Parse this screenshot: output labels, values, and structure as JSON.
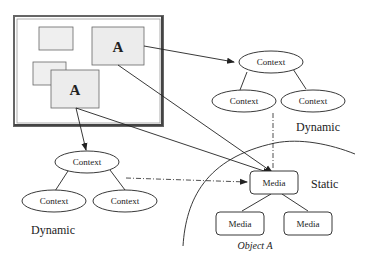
{
  "diagram": {
    "screen": {
      "windows": [
        {
          "label": ""
        },
        {
          "label": "A"
        },
        {
          "label": ""
        },
        {
          "label": "A"
        }
      ]
    },
    "top_context_tree": {
      "root": "Context",
      "children": [
        "Context",
        "Context"
      ],
      "region_label": "Dynamic"
    },
    "left_context_tree": {
      "root": "Context",
      "children": [
        "Context",
        "Context"
      ],
      "region_label": "Dynamic"
    },
    "media_tree": {
      "root": "Media",
      "children": [
        "Media",
        "Media"
      ],
      "region_label": "Static",
      "caption": "Object A"
    },
    "colors": {
      "stroke": "#222222",
      "window_fill": "#ececec",
      "frame_border": "#555555"
    }
  }
}
